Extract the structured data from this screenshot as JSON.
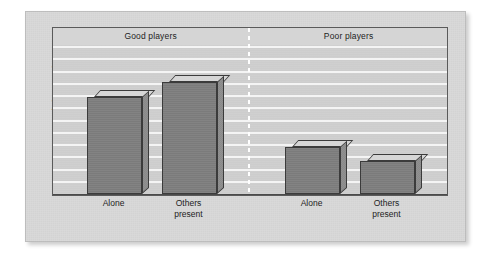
{
  "chart_data": {
    "type": "bar",
    "title": "",
    "xlabel": "",
    "ylabel": "Percentage of shots made",
    "ylim": [
      0,
      100
    ],
    "grid": true,
    "gridline_count": 12,
    "legend": "none",
    "groups": [
      {
        "name": "Good players",
        "categories": [
          "Alone",
          "Others\npresent"
        ],
        "values": [
          68,
          78
        ]
      },
      {
        "name": "Poor players",
        "categories": [
          "Alone",
          "Others\npresent"
        ],
        "values": [
          33,
          23
        ]
      }
    ],
    "categories": [
      "Alone",
      "Others present",
      "Alone",
      "Others present"
    ],
    "values": [
      68,
      78,
      33,
      23
    ],
    "colors": {
      "bar_front": "#7f7f7f",
      "bar_top": "#d6d6d6",
      "bar_side": "#8d8d8d",
      "bar_outline": "#3b3b3b",
      "plot_background": "#cfcfcf",
      "gridline": "#f4f4f4",
      "frame": "#5a5a5a",
      "panel": "#d9d9d9",
      "text": "#1d1d1d"
    }
  },
  "axis": {
    "y_title": "Percentage of shots made"
  },
  "groups": {
    "good": "Good players",
    "poor": "Poor players"
  },
  "labels": {
    "alone": "Alone",
    "others_present": "Others\npresent"
  }
}
